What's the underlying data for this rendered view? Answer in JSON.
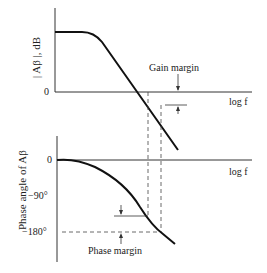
{
  "gain_plot": {
    "ylabel": "| Aβ |, dB",
    "zero_tick": "0",
    "xlabel": "log f",
    "annotation": "Gain margin"
  },
  "phase_plot": {
    "ylabel": "Phase angle of Aβ",
    "ticks": [
      "0",
      "−90°",
      "−180°"
    ],
    "xlabel": "log f",
    "annotation": "Phase margin"
  },
  "colors": {
    "line": "#1a1a1a",
    "background": "#ffffff"
  }
}
